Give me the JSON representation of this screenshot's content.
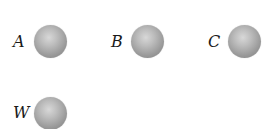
{
  "diagram": {
    "spheres": [
      {
        "label": "A",
        "color": "#a6a6a6"
      },
      {
        "label": "B",
        "color": "#a6a6a6"
      },
      {
        "label": "C",
        "color": "#a6a6a6"
      },
      {
        "label": "W",
        "color": "#a6a6a6"
      }
    ]
  }
}
